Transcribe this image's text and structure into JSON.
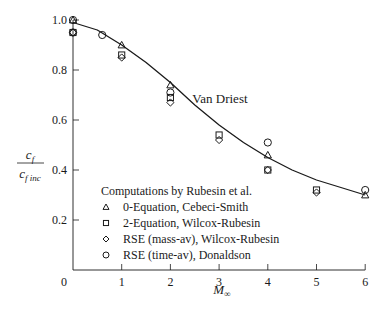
{
  "chart_data": {
    "type": "scatter",
    "title": "",
    "xlabel": "M∞",
    "ylabel": "c_f / c_f inc",
    "xlim": [
      0,
      6
    ],
    "ylim": [
      0,
      1.0
    ],
    "grid": false,
    "x_ticks": [
      "0",
      "1",
      "2",
      "3",
      "4",
      "5",
      "6"
    ],
    "y_ticks": [
      "0.2",
      "0.4",
      "0.6",
      "0.8",
      "1.0"
    ],
    "annotations": [
      {
        "text": "Van Driest",
        "x": 2.45,
        "y": 0.67
      }
    ],
    "legend": {
      "title": "Computations by Rubesin et al.",
      "position": "lower-left",
      "entries": [
        {
          "marker": "triangle",
          "label": "0-Equation, Cebeci-Smith"
        },
        {
          "marker": "square",
          "label": "2-Equation, Wilcox-Rubesin"
        },
        {
          "marker": "diamond",
          "label": "RSE (mass-av), Wilcox-Rubesin"
        },
        {
          "marker": "circle",
          "label": "RSE (time-av), Donaldson"
        }
      ]
    },
    "series": [
      {
        "name": "Van Driest",
        "kind": "line",
        "x": [
          0,
          0.5,
          1,
          1.5,
          2,
          2.5,
          3,
          3.5,
          4,
          4.5,
          5,
          5.5,
          6
        ],
        "y": [
          0.99,
          0.96,
          0.9,
          0.83,
          0.75,
          0.66,
          0.58,
          0.51,
          0.45,
          0.4,
          0.36,
          0.33,
          0.3
        ]
      },
      {
        "name": "0-Equation, Cebeci-Smith",
        "marker": "triangle",
        "x": [
          0,
          1,
          2,
          4,
          6
        ],
        "y": [
          1.0,
          0.9,
          0.74,
          0.46,
          0.3
        ]
      },
      {
        "name": "2-Equation, Wilcox-Rubesin",
        "marker": "square",
        "x": [
          0,
          1,
          2,
          3,
          4,
          5
        ],
        "y": [
          0.95,
          0.86,
          0.69,
          0.54,
          0.4,
          0.32
        ]
      },
      {
        "name": "RSE (mass-av), Wilcox-Rubesin",
        "marker": "diamond",
        "x": [
          0,
          1,
          2,
          3,
          4,
          5
        ],
        "y": [
          0.95,
          0.85,
          0.67,
          0.52,
          0.4,
          0.31
        ]
      },
      {
        "name": "RSE (time-av), Donaldson",
        "marker": "circle",
        "x": [
          0,
          0,
          0.6,
          2,
          4,
          6
        ],
        "y": [
          1.0,
          0.95,
          0.94,
          0.71,
          0.51,
          0.32
        ]
      }
    ]
  }
}
